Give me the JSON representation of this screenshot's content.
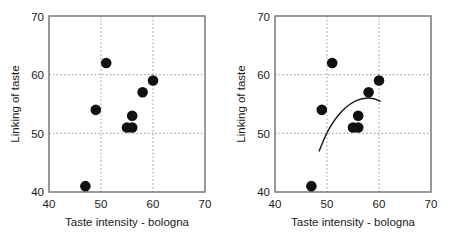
{
  "chart_data": [
    {
      "type": "scatter",
      "panel": "left",
      "title": "",
      "xlabel": "Taste intensity - bologna",
      "ylabel": "Linking of taste",
      "xlim": [
        40,
        70
      ],
      "ylim": [
        40,
        70
      ],
      "xticks": [
        40,
        50,
        60,
        70
      ],
      "yticks": [
        40,
        50,
        60,
        70
      ],
      "xtick_labels": [
        "40",
        "50",
        "60",
        "70"
      ],
      "ytick_labels": [
        "40",
        "50",
        "60",
        "70"
      ],
      "grid": true,
      "gridlines_x": [
        50,
        60
      ],
      "gridlines_y": [
        50,
        60
      ],
      "grid_style": "dotted",
      "legend": "none",
      "marker": "filled-circle",
      "marker_color": "#111111",
      "points": [
        {
          "x": 47,
          "y": 41
        },
        {
          "x": 49,
          "y": 54
        },
        {
          "x": 51,
          "y": 62
        },
        {
          "x": 55,
          "y": 51
        },
        {
          "x": 56,
          "y": 51
        },
        {
          "x": 56,
          "y": 53
        },
        {
          "x": 58,
          "y": 57
        },
        {
          "x": 60,
          "y": 59
        }
      ],
      "fit_curve": null
    },
    {
      "type": "scatter",
      "panel": "right",
      "title": "",
      "xlabel": "Taste intensity - bologna",
      "ylabel": "Linking of taste",
      "xlim": [
        40,
        70
      ],
      "ylim": [
        40,
        70
      ],
      "xticks": [
        40,
        50,
        60,
        70
      ],
      "yticks": [
        40,
        50,
        60,
        70
      ],
      "xtick_labels": [
        "40",
        "50",
        "60",
        "70"
      ],
      "ytick_labels": [
        "40",
        "50",
        "60",
        "70"
      ],
      "grid": true,
      "gridlines_x": [
        50,
        60
      ],
      "gridlines_y": [
        50,
        60
      ],
      "grid_style": "dotted",
      "legend": "none",
      "marker": "filled-circle",
      "marker_color": "#111111",
      "points": [
        {
          "x": 47,
          "y": 41
        },
        {
          "x": 49,
          "y": 54
        },
        {
          "x": 51,
          "y": 62
        },
        {
          "x": 55,
          "y": 51
        },
        {
          "x": 56,
          "y": 51
        },
        {
          "x": 56,
          "y": 53
        },
        {
          "x": 58,
          "y": 57
        },
        {
          "x": 60,
          "y": 59
        }
      ],
      "fit_curve": {
        "shape": "quadratic",
        "color": "#1a1a1a",
        "x_start": 48.5,
        "x_end": 60.2,
        "points": [
          {
            "x": 48.5,
            "y": 47.0
          },
          {
            "x": 50.0,
            "y": 50.1
          },
          {
            "x": 51.5,
            "y": 52.3
          },
          {
            "x": 53.0,
            "y": 53.9
          },
          {
            "x": 54.5,
            "y": 55.0
          },
          {
            "x": 56.0,
            "y": 55.7
          },
          {
            "x": 57.5,
            "y": 56.0
          },
          {
            "x": 59.0,
            "y": 55.9
          },
          {
            "x": 60.2,
            "y": 55.5
          }
        ]
      }
    }
  ],
  "panels": [
    {
      "name": "left-panel",
      "xlabel": "Taste intensity - bologna",
      "ylabel": "Linking of taste",
      "xtick_labels": [
        "40",
        "50",
        "60",
        "70"
      ],
      "ytick_labels": [
        "70",
        "60",
        "50",
        "40"
      ]
    },
    {
      "name": "right-panel",
      "xlabel": "Taste intensity - bologna",
      "ylabel": "Linking of taste",
      "xtick_labels": [
        "40",
        "50",
        "60",
        "70"
      ],
      "ytick_labels": [
        "70",
        "60",
        "50",
        "40"
      ]
    }
  ],
  "colors": {
    "marker": "#111111",
    "frame": "#6e6e6e",
    "grid": "#9a9a9a",
    "curve": "#1a1a1a",
    "text": "#1a1a1a",
    "background": "#ffffff"
  }
}
